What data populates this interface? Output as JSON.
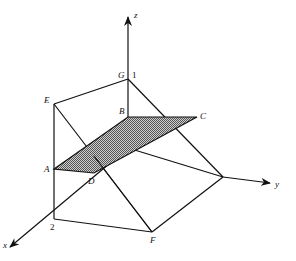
{
  "diagram": {
    "type": "3d-coordinate-solid",
    "axes": {
      "x": {
        "label": "x"
      },
      "y": {
        "label": "y"
      },
      "z": {
        "label": "z"
      }
    },
    "points": {
      "A": "A",
      "B": "B",
      "C": "C",
      "D": "D",
      "E": "E",
      "F": "F",
      "G": "G"
    },
    "ticks": {
      "z_one": "1",
      "x_two": "2"
    },
    "shaded_region": "ABCD",
    "colors": {
      "line": "#111111",
      "shade": "#8a8a8a",
      "background": "#ffffff"
    }
  }
}
